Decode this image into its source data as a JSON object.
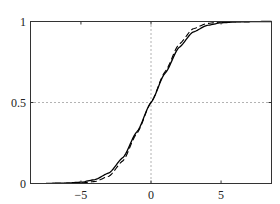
{
  "chart_data": {
    "type": "line",
    "title": "",
    "xlabel": "",
    "ylabel": "",
    "xlim": [
      -8.6,
      8.6
    ],
    "ylim": [
      0,
      1
    ],
    "xticks": [
      -5,
      0,
      5
    ],
    "xtick_labels": [
      "−5",
      "0",
      "5"
    ],
    "yticks": [
      0,
      0.5,
      1
    ],
    "ytick_labels": [
      "0",
      "0.5",
      "1"
    ],
    "grid": "dotted reference lines at x=0 and y=0.5",
    "legend": null,
    "series": [
      {
        "name": "solid curve",
        "style": "solid",
        "color": "#000000",
        "x": [
          -8,
          -6,
          -5,
          -4,
          -3,
          -2,
          -1,
          0,
          1,
          2,
          3,
          4,
          5,
          6,
          8
        ],
        "y": [
          0.0,
          0.003,
          0.008,
          0.024,
          0.065,
          0.16,
          0.32,
          0.5,
          0.68,
          0.84,
          0.935,
          0.976,
          0.992,
          0.997,
          1.0
        ]
      },
      {
        "name": "dashed curve",
        "style": "dashed",
        "color": "#000000",
        "x": [
          -8,
          -6,
          -5,
          -4,
          -3,
          -2,
          -1,
          0,
          1,
          2,
          3,
          4,
          5,
          6,
          8
        ],
        "y": [
          0.0,
          0.001,
          0.003,
          0.012,
          0.045,
          0.14,
          0.31,
          0.5,
          0.69,
          0.86,
          0.955,
          0.988,
          0.997,
          0.999,
          1.0
        ]
      }
    ]
  }
}
